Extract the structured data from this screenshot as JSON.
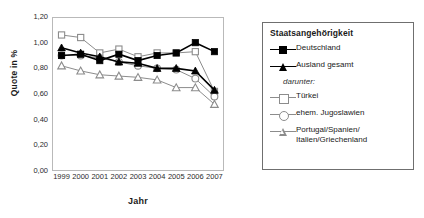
{
  "chart_data": {
    "type": "line",
    "title": "",
    "xlabel": "Jahr",
    "ylabel": "Quote in %",
    "categories": [
      "1999",
      "2000",
      "2001",
      "2002",
      "2003",
      "2004",
      "2005",
      "2006",
      "2007"
    ],
    "x": [
      1999,
      2000,
      2001,
      2002,
      2003,
      2004,
      2005,
      2006,
      2007
    ],
    "ylim": [
      0.0,
      1.2
    ],
    "yticks": [
      "0,00",
      "0,20",
      "0,40",
      "0,60",
      "0,80",
      "1,00",
      "1,20"
    ],
    "ytick_values": [
      0.0,
      0.2,
      0.4,
      0.6,
      0.8,
      1.0,
      1.2
    ],
    "ytick_step": 0.2,
    "grid": false,
    "legend_position": "right",
    "series": [
      {
        "name": "Deutschland",
        "marker": "filled-square",
        "color": "#000000",
        "values": [
          0.9,
          0.91,
          0.86,
          0.91,
          0.86,
          0.9,
          0.92,
          1.0,
          0.93
        ]
      },
      {
        "name": "Ausland gesamt",
        "marker": "filled-triangle",
        "color": "#000000",
        "values": [
          0.96,
          0.92,
          0.89,
          0.85,
          0.84,
          0.8,
          0.8,
          0.78,
          0.63
        ]
      },
      {
        "name": "Türkei",
        "marker": "open-square",
        "color": "#8c8c8c",
        "values": [
          1.06,
          1.04,
          0.92,
          0.95,
          0.89,
          0.92,
          0.92,
          0.93,
          0.62
        ]
      },
      {
        "name": "ehem. Jugoslawien",
        "marker": "open-circle",
        "color": "#8c8c8c",
        "values": [
          0.9,
          0.9,
          0.88,
          0.85,
          0.82,
          0.8,
          0.79,
          0.72,
          0.58
        ]
      },
      {
        "name": "Portugal/Spanien/Italien/Griechenland",
        "marker": "open-triangle",
        "color": "#8c8c8c",
        "values": [
          0.82,
          0.78,
          0.75,
          0.74,
          0.73,
          0.71,
          0.65,
          0.65,
          0.52
        ]
      }
    ]
  },
  "legend": {
    "title": "Staatsangehörigkeit",
    "subheading": "darunter:",
    "entries": [
      {
        "label": "Deutschland",
        "key": "filled-square-line"
      },
      {
        "label": "Ausland gesamt",
        "key": "filled-triangle-line"
      },
      {
        "label": "Türkei",
        "key": "open-square-line"
      },
      {
        "label": "ehem. Jugoslawien",
        "key": "open-circle-line"
      },
      {
        "label": "Portugal/Spanien/",
        "label2": "Italien/Griechenland",
        "key": "open-triangle-line"
      }
    ]
  },
  "colors": {
    "black": "#000000",
    "grey": "#8c8c8c",
    "frame": "#b9b9b9",
    "legend_border": "#6f6f6f"
  }
}
